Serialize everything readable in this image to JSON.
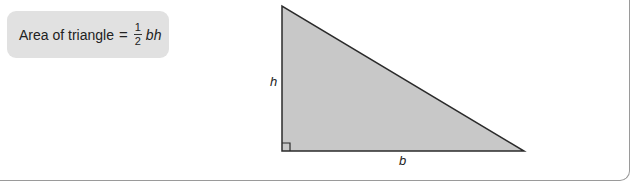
{
  "formula": {
    "prefix": "Area of triangle",
    "equals": "=",
    "fraction_numerator": "1",
    "fraction_denominator": "2",
    "variables": "bh"
  },
  "triangle": {
    "height_label": "h",
    "base_label": "b",
    "vertices": [
      [
        282,
        6
      ],
      [
        282,
        151
      ],
      [
        524,
        151
      ]
    ],
    "fill_color": "#c8c8c8",
    "stroke_color": "#2b2b2b",
    "right_angle_marker": true
  },
  "colors": {
    "formula_bg": "#e1e1e1",
    "frame_border": "#9a9a9a"
  }
}
